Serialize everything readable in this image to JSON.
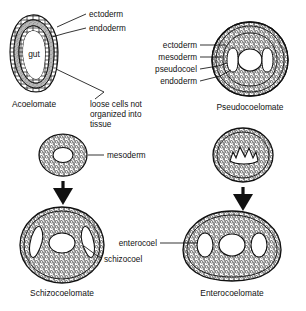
{
  "figure": {
    "background_color": "#ffffff",
    "ink_color": "#111111",
    "tissue_fill_color": "#b7b7b7",
    "cavity_fill_color": "#ffffff"
  },
  "panels": [
    {
      "id": "acoelomate",
      "caption": "Acoelomate",
      "inner_labels": [
        {
          "text": "gut"
        }
      ],
      "callouts": [
        {
          "text": "ectoderm"
        },
        {
          "text": "endoderm"
        },
        {
          "text": "loose cells not"
        },
        {
          "text": "organized into"
        },
        {
          "text": "tissue"
        }
      ]
    },
    {
      "id": "pseudocoelomate",
      "caption": "Pseudocoelomate",
      "callouts": [
        {
          "text": "ectoderm"
        },
        {
          "text": "mesoderm"
        },
        {
          "text": "pseudocoel"
        },
        {
          "text": "endoderm"
        }
      ]
    },
    {
      "id": "mesoderm-ring",
      "caption": "",
      "callouts": [
        {
          "text": "mesoderm"
        }
      ]
    },
    {
      "id": "coelom-forming-ring",
      "caption": "",
      "callouts": []
    },
    {
      "id": "schizocoelomate",
      "caption": "Schizocoelomate",
      "callouts": [
        {
          "text": "schizocoel"
        }
      ]
    },
    {
      "id": "enterocoelomate",
      "caption": "Enterocoelomate",
      "callouts": [
        {
          "text": "enterocoel"
        }
      ]
    }
  ],
  "labels": {
    "ectoderm_top": "ectoderm",
    "endoderm_top": "endoderm",
    "gut": "gut",
    "acoelomate_caption": "Acoelomate",
    "loose_cells_line1": "loose cells not",
    "loose_cells_line2": "organized into",
    "loose_cells_line3": "tissue",
    "pseudo_ectoderm": "ectoderm",
    "pseudo_mesoderm": "mesoderm",
    "pseudo_pseudocoel": "pseudocoel",
    "pseudo_endoderm": "endoderm",
    "pseudocoelomate_caption": "Pseudocoelomate",
    "mesoderm": "mesoderm",
    "schizocoel": "schizocoel",
    "schizocoelomate_caption": "Schizocoelomate",
    "enterocoel": "enterocoel",
    "enterocoelomate_caption": "Enterocoelomate"
  }
}
